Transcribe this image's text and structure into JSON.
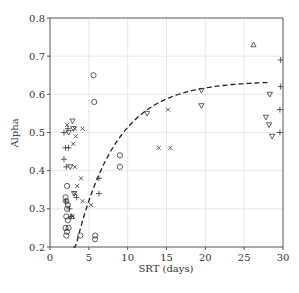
{
  "chart_data": {
    "type": "scatter",
    "title": "",
    "xlabel": "SRT (days)",
    "ylabel": "Alpha",
    "xlim": [
      0,
      30
    ],
    "ylim": [
      0.2,
      0.8
    ],
    "xticks": [
      0,
      5,
      10,
      15,
      20,
      25,
      30
    ],
    "yticks": [
      0.2,
      0.3,
      0.4,
      0.5,
      0.6,
      0.7,
      0.8
    ],
    "xtick_labels": [
      "0",
      "5",
      "10",
      "15",
      "20",
      "25",
      "30"
    ],
    "ytick_labels": [
      "0.2",
      "0.3",
      "0.4",
      "0.5",
      "0.6",
      "0.7",
      "0.8"
    ],
    "grid": true,
    "legend": null,
    "series": [
      {
        "name": "circles",
        "marker": "circle",
        "points": [
          [
            5.6,
            0.65
          ],
          [
            5.7,
            0.58
          ],
          [
            9.0,
            0.44
          ],
          [
            9.0,
            0.41
          ],
          [
            2.2,
            0.36
          ],
          [
            2.0,
            0.33
          ],
          [
            2.1,
            0.32
          ],
          [
            2.3,
            0.31
          ],
          [
            2.2,
            0.3
          ],
          [
            2.1,
            0.28
          ],
          [
            2.3,
            0.27
          ],
          [
            2.0,
            0.25
          ],
          [
            2.4,
            0.25
          ],
          [
            2.2,
            0.24
          ],
          [
            2.1,
            0.23
          ],
          [
            3.9,
            0.23
          ],
          [
            5.8,
            0.23
          ],
          [
            5.8,
            0.22
          ]
        ]
      },
      {
        "name": "plus",
        "marker": "plus",
        "points": [
          [
            1.8,
            0.5
          ],
          [
            2.3,
            0.51
          ],
          [
            2.4,
            0.46
          ],
          [
            2.0,
            0.46
          ],
          [
            1.8,
            0.43
          ],
          [
            2.1,
            0.41
          ],
          [
            6.3,
            0.38
          ],
          [
            6.3,
            0.34
          ],
          [
            2.0,
            0.32
          ],
          [
            2.5,
            0.3
          ],
          [
            2.7,
            0.28
          ],
          [
            3.4,
            0.33
          ],
          [
            29.7,
            0.69
          ],
          [
            29.7,
            0.62
          ],
          [
            29.6,
            0.56
          ],
          [
            29.6,
            0.5
          ]
        ]
      },
      {
        "name": "cross",
        "marker": "x",
        "points": [
          [
            2.2,
            0.52
          ],
          [
            3.2,
            0.51
          ],
          [
            4.2,
            0.51
          ],
          [
            3.3,
            0.49
          ],
          [
            3.0,
            0.47
          ],
          [
            3.2,
            0.41
          ],
          [
            4.0,
            0.38
          ],
          [
            3.5,
            0.36
          ],
          [
            3.2,
            0.34
          ],
          [
            4.2,
            0.32
          ],
          [
            5.3,
            0.31
          ],
          [
            2.9,
            0.28
          ],
          [
            15.2,
            0.56
          ],
          [
            14.0,
            0.46
          ],
          [
            15.5,
            0.46
          ]
        ]
      },
      {
        "name": "triangle-down",
        "marker": "triangle-down",
        "points": [
          [
            2.9,
            0.53
          ],
          [
            2.4,
            0.5
          ],
          [
            3.0,
            0.51
          ],
          [
            2.6,
            0.41
          ],
          [
            3.1,
            0.34
          ],
          [
            12.5,
            0.55
          ],
          [
            19.5,
            0.61
          ],
          [
            19.5,
            0.57
          ],
          [
            28.3,
            0.6
          ],
          [
            27.8,
            0.54
          ],
          [
            28.2,
            0.52
          ],
          [
            28.6,
            0.49
          ]
        ]
      },
      {
        "name": "triangle-up",
        "marker": "triangle-up",
        "points": [
          [
            26.2,
            0.73
          ],
          [
            2.8,
            0.28
          ]
        ]
      }
    ],
    "fit_curve": {
      "style": "dashed",
      "equation": "alpha = 0.635 * (1 - exp(-0.19 * (SRT - 1.3)))",
      "x_range": [
        3.0,
        28.0
      ]
    }
  }
}
